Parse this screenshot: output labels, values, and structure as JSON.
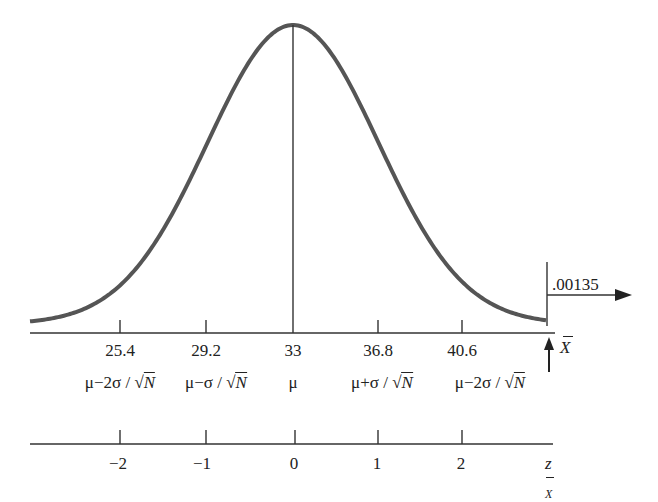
{
  "chart_data": {
    "type": "line",
    "title": "",
    "curve": "normal density centered at mu",
    "mean": 33,
    "standard_error": 3.8,
    "x": [
      25.4,
      29.2,
      33,
      36.8,
      40.6
    ],
    "z": [
      -2,
      -1,
      0,
      1,
      2
    ],
    "xlabel": "X̄",
    "zlabel": "z_X̄",
    "tick_labels_raw": [
      "25.4",
      "29.2",
      "33",
      "36.8",
      "40.6"
    ],
    "tick_labels_symbolic": [
      "μ−2σ/√N",
      "μ−σ/√N",
      "μ",
      "μ+σ/√N",
      "μ−2σ/√N"
    ],
    "tick_labels_z": [
      "−2",
      "−1",
      "0",
      "1",
      "2"
    ],
    "annotation": {
      "text": ".00135",
      "meaning": "upper tail area beyond cutoff (marked by vertical line and right arrow)",
      "cutoff_z": 3
    },
    "center_line": true,
    "grid": false,
    "legend": null
  },
  "labels": {
    "raw": [
      "25.4",
      "29.2",
      "33",
      "36.8",
      "40.6"
    ],
    "symbolic": [
      {
        "pre": "μ−2σ / ",
        "root": "N"
      },
      {
        "pre": "μ−σ / ",
        "root": "N"
      },
      {
        "pre": "μ",
        "root": ""
      },
      {
        "pre": "μ+σ / ",
        "root": "N"
      },
      {
        "pre": "μ−2σ / ",
        "root": "N"
      }
    ],
    "z": [
      "−2",
      "−1",
      "0",
      "1",
      "2"
    ],
    "xbar_axis": "X",
    "z_axis_main": "z",
    "z_axis_sub": "X",
    "tail_prob": ".00135",
    "sqrt_sign": "√"
  }
}
